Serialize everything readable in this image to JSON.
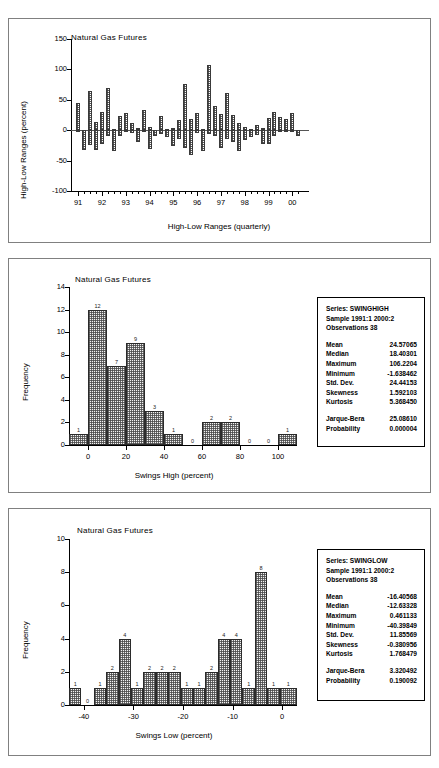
{
  "figure": {
    "background": "#ffffff",
    "panel_border": "#808080"
  },
  "chart_data": [
    {
      "id": "high-low-ranges",
      "type": "bar",
      "title": "Natural Gas Futures",
      "xlabel": "High-Low Ranges (quarterly)",
      "ylabel": "High-Low Ranges (percent)",
      "ylim": [
        -100,
        150
      ],
      "ytick_labels": [
        "150",
        "100",
        "50",
        "0",
        "-50",
        "-100"
      ],
      "ytick_values": [
        150,
        100,
        50,
        0,
        -50,
        -100
      ],
      "xtick_labels": [
        "91",
        "92",
        "93",
        "94",
        "95",
        "96",
        "97",
        "98",
        "99",
        "00"
      ],
      "xtick_values": [
        1991,
        1992,
        1993,
        1994,
        1995,
        1996,
        1997,
        1998,
        1999,
        2000
      ],
      "grid": false,
      "legend": "none",
      "categories": [
        "1991:1",
        "1991:2",
        "1991:3",
        "1991:4",
        "1992:1",
        "1992:2",
        "1992:3",
        "1992:4",
        "1993:1",
        "1993:2",
        "1993:3",
        "1993:4",
        "1994:1",
        "1994:2",
        "1994:3",
        "1994:4",
        "1995:1",
        "1995:2",
        "1995:3",
        "1995:4",
        "1996:1",
        "1996:2",
        "1996:3",
        "1996:4",
        "1997:1",
        "1997:2",
        "1997:3",
        "1997:4",
        "1998:1",
        "1998:2",
        "1998:3",
        "1998:4",
        "1999:1",
        "1999:2",
        "1999:3",
        "1999:4",
        "2000:1",
        "2000:2"
      ],
      "values_high": [
        44,
        -2,
        65,
        13,
        30,
        70,
        2,
        24,
        28,
        12,
        4,
        34,
        6,
        -1,
        24,
        2,
        4,
        16,
        76,
        18,
        28,
        2,
        107,
        39,
        27,
        61,
        25,
        12,
        6,
        2,
        9,
        4,
        20,
        30,
        22,
        18,
        28,
        -1
      ],
      "values_low": [
        -2,
        -32,
        -24,
        -32,
        -22,
        -10,
        -34,
        -9,
        -2,
        -4,
        -20,
        -3,
        -31,
        -10,
        -7,
        -11,
        -26,
        -14,
        -30,
        -40,
        -4,
        -34,
        -6,
        -10,
        -29,
        -15,
        -20,
        -34,
        -16,
        -12,
        -8,
        -22,
        -23,
        -10,
        -2,
        -1,
        -1,
        -9
      ]
    },
    {
      "id": "swings-high-histogram",
      "type": "bar",
      "title": "Natural Gas Futures",
      "xlabel": "Swings High (percent)",
      "ylabel": "Frequency",
      "ylim": [
        0,
        14
      ],
      "ytick_labels": [
        "0",
        "2",
        "4",
        "6",
        "8",
        "10",
        "12",
        "14"
      ],
      "ytick_values": [
        0,
        2,
        4,
        6,
        8,
        10,
        12,
        14
      ],
      "xtick_labels": [
        "0",
        "20",
        "40",
        "60",
        "80",
        "100"
      ],
      "xtick_values": [
        0,
        20,
        40,
        60,
        80,
        100
      ],
      "xlim": [
        -10,
        110
      ],
      "grid": false,
      "legend": "none",
      "bin_edges": [
        -10,
        0,
        10,
        20,
        30,
        40,
        50,
        60,
        70,
        80,
        90,
        100,
        110
      ],
      "values": [
        1,
        12,
        7,
        9,
        3,
        1,
        0,
        2,
        2,
        0,
        0,
        1
      ],
      "bar_labels": [
        "1",
        "12",
        "7",
        "9",
        "3",
        "1",
        "0",
        "2",
        "2",
        "0",
        "0",
        "1"
      ]
    },
    {
      "id": "swings-low-histogram",
      "type": "bar",
      "title": "Natural Gas Futures",
      "xlabel": "Swings Low (percent)",
      "ylabel": "Frequency",
      "ylim": [
        0,
        10
      ],
      "ytick_labels": [
        "0",
        "2",
        "4",
        "6",
        "8",
        "10"
      ],
      "ytick_values": [
        0,
        2,
        4,
        6,
        8,
        10
      ],
      "xtick_labels": [
        "-40",
        "-30",
        "-20",
        "-10",
        "0"
      ],
      "xtick_values": [
        -40,
        -30,
        -20,
        -10,
        0
      ],
      "xlim": [
        -43,
        3
      ],
      "grid": false,
      "legend": "none",
      "bin_edges": [
        -43,
        -40.5,
        -38,
        -35.5,
        -33,
        -30.5,
        -28,
        -25.5,
        -23,
        -20.5,
        -18,
        -15.5,
        -13,
        -10.5,
        -8,
        -5.5,
        -3,
        -0.5,
        3
      ],
      "values": [
        1,
        0,
        1,
        2,
        4,
        1,
        2,
        2,
        2,
        1,
        1,
        2,
        4,
        4,
        1,
        8,
        1,
        1
      ],
      "bar_labels": [
        "1",
        "0",
        "1",
        "2",
        "4",
        "1",
        "2",
        "2",
        "2",
        "1",
        "1",
        "2",
        "4",
        "4",
        "1",
        "8",
        "1",
        "1"
      ]
    }
  ],
  "stats_high": {
    "series_line": "Series: SWINGHIGH",
    "sample_line": "Sample 1991:1 2000:2",
    "observations_line": "Observations 38",
    "rows": [
      {
        "key": "Mean",
        "value": "24.57065"
      },
      {
        "key": "Median",
        "value": "18.40301"
      },
      {
        "key": "Maximum",
        "value": "106.2204"
      },
      {
        "key": "Minimum",
        "value": "-1.638462"
      },
      {
        "key": "Std. Dev.",
        "value": "24.44153"
      },
      {
        "key": "Skewness",
        "value": "1.592103"
      },
      {
        "key": "Kurtosis",
        "value": "5.368450"
      }
    ],
    "tail_rows": [
      {
        "key": "Jarque-Bera",
        "value": "25.08610"
      },
      {
        "key": "Probability",
        "value": "0.000004"
      }
    ]
  },
  "stats_low": {
    "series_line": "Series: SWINGLOW",
    "sample_line": "Sample 1991:1 2000:2",
    "observations_line": "Observations 38",
    "rows": [
      {
        "key": "Mean",
        "value": "-16.40568"
      },
      {
        "key": "Median",
        "value": "-12.63328"
      },
      {
        "key": "Maximum",
        "value": "0.461133"
      },
      {
        "key": "Minimum",
        "value": "-40.39849"
      },
      {
        "key": "Std. Dev.",
        "value": "11.85569"
      },
      {
        "key": "Skewness",
        "value": "-0.380956"
      },
      {
        "key": "Kurtosis",
        "value": "1.768479"
      }
    ],
    "tail_rows": [
      {
        "key": "Jarque-Bera",
        "value": "3.320492"
      },
      {
        "key": "Probability",
        "value": "0.190092"
      }
    ]
  }
}
